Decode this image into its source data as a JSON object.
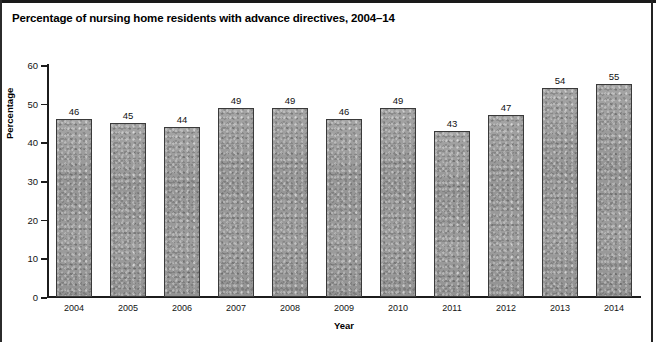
{
  "figure": {
    "title": "Percentage of nursing home residents with advance directives, 2004–14",
    "footnote": ""
  },
  "chart_data": {
    "type": "bar",
    "title": "Percentage of nursing home residents with advance directives, 2004–14",
    "xlabel": "Year",
    "ylabel": "Percentage",
    "categories": [
      "2004",
      "2005",
      "2006",
      "2007",
      "2008",
      "2009",
      "2010",
      "2011",
      "2012",
      "2013",
      "2014"
    ],
    "values": [
      46,
      45,
      44,
      49,
      49,
      46,
      49,
      43,
      47,
      54,
      55
    ],
    "ylim": [
      0,
      60
    ],
    "yticks": [
      0,
      10,
      20,
      30,
      40,
      50,
      60
    ],
    "ytick_labels": [
      "0",
      "10",
      "20",
      "30",
      "40",
      "50",
      "60"
    ],
    "grid": false,
    "legend": null,
    "bar_color": "#9a9a9a",
    "bar_edge_color": "#3a3a3a",
    "show_value_labels": true
  }
}
